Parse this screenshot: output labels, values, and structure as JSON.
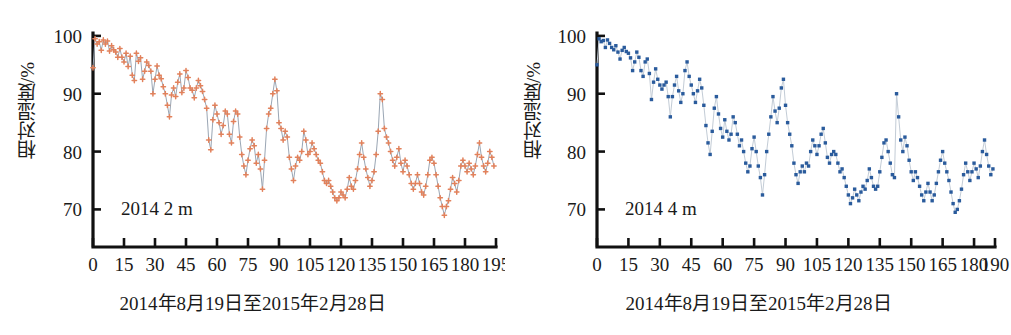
{
  "figure": {
    "background_color": "#ffffff",
    "axis_color": "#111111",
    "panels": [
      {
        "key": "left",
        "annotation": "2014  2 m",
        "caption": "2014年8月19日至2015年2月28日",
        "y_axis_title": "相对湿度/%",
        "marker_color": "#e2815b",
        "line_color": "#9aa6b4"
      },
      {
        "key": "right",
        "annotation": "2014  4 m",
        "caption": "2014年8月19日至2015年2月28日",
        "y_axis_title": "相对湿度/%",
        "marker_color": "#2a5b9c",
        "line_color": "#c3ccd6"
      }
    ]
  },
  "chart_data": [
    {
      "type": "line",
      "title": "",
      "subtitle": "",
      "annotation": "2014  2 m",
      "xlabel": "2014年8月19日至2015年2月28日",
      "ylabel": "相对湿度/%",
      "xlim": [
        0,
        195
      ],
      "ylim": [
        63.5,
        100.5
      ],
      "xticks": [
        0,
        15,
        30,
        45,
        60,
        75,
        90,
        105,
        120,
        135,
        150,
        165,
        180,
        195
      ],
      "xtick_labels": [
        "0",
        "15",
        "30",
        "45",
        "60",
        "75",
        "90",
        "105",
        "120",
        "135",
        "150",
        "165",
        "180",
        "195"
      ],
      "yticks": [
        70,
        80,
        90,
        100
      ],
      "ytick_labels": [
        "70",
        "80",
        "90",
        "100"
      ],
      "grid": false,
      "legend": "none",
      "marker": "cross",
      "marker_color": "#e2815b",
      "line_color": "#9aa6b4",
      "series": [
        {
          "name": "2014 2 m",
          "x": [
            0,
            1,
            2,
            3,
            4,
            5,
            6,
            7,
            8,
            9,
            10,
            11,
            12,
            13,
            14,
            15,
            16,
            17,
            18,
            19,
            20,
            21,
            22,
            23,
            24,
            25,
            26,
            27,
            28,
            29,
            30,
            31,
            32,
            33,
            34,
            35,
            36,
            37,
            38,
            39,
            40,
            41,
            42,
            43,
            44,
            45,
            46,
            47,
            48,
            49,
            50,
            51,
            52,
            53,
            54,
            55,
            56,
            57,
            58,
            59,
            60,
            61,
            62,
            63,
            64,
            65,
            66,
            67,
            68,
            69,
            70,
            71,
            72,
            73,
            74,
            75,
            76,
            77,
            78,
            79,
            80,
            81,
            82,
            83,
            84,
            85,
            86,
            87,
            88,
            89,
            90,
            91,
            92,
            93,
            94,
            95,
            96,
            97,
            98,
            99,
            100,
            101,
            102,
            103,
            104,
            105,
            106,
            107,
            108,
            109,
            110,
            111,
            112,
            113,
            114,
            115,
            116,
            117,
            118,
            119,
            120,
            121,
            122,
            123,
            124,
            125,
            126,
            127,
            128,
            129,
            130,
            131,
            132,
            133,
            134,
            135,
            136,
            137,
            138,
            139,
            140,
            141,
            142,
            143,
            144,
            145,
            146,
            147,
            148,
            149,
            150,
            151,
            152,
            153,
            154,
            155,
            156,
            157,
            158,
            159,
            160,
            161,
            162,
            163,
            164,
            165,
            166,
            167,
            168,
            169,
            170,
            171,
            172,
            173,
            174,
            175,
            176,
            177,
            178,
            179,
            180,
            181,
            182,
            183,
            184,
            185,
            186,
            187,
            188,
            189,
            190,
            191,
            192,
            193,
            194
          ],
          "values": [
            94.5,
            99.5,
            98.6,
            99.0,
            97.5,
            99.3,
            98.6,
            99.1,
            97.4,
            98.3,
            97.6,
            97.2,
            96.3,
            97.8,
            96.3,
            95.5,
            97.0,
            94.7,
            96.5,
            93.2,
            92.3,
            97.0,
            95.6,
            96.2,
            92.5,
            93.9,
            95.5,
            94.9,
            93.9,
            90.0,
            92.5,
            94.8,
            93.2,
            92.6,
            91.2,
            90.0,
            88.0,
            86.0,
            89.8,
            91.0,
            89.5,
            92.0,
            93.4,
            90.2,
            91.0,
            94.0,
            92.8,
            91.0,
            90.6,
            89.3,
            91.0,
            92.3,
            91.4,
            90.4,
            89.0,
            87.5,
            82.0,
            80.3,
            85.5,
            88.0,
            86.5,
            85.0,
            83.0,
            84.5,
            87.0,
            86.5,
            83.0,
            81.5,
            85.2,
            87.0,
            86.5,
            82.5,
            79.5,
            77.5,
            76.0,
            78.5,
            80.5,
            82.0,
            81.0,
            78.0,
            79.5,
            77.0,
            73.5,
            78.5,
            84.0,
            86.5,
            87.5,
            90.0,
            92.5,
            90.5,
            85.0,
            84.0,
            82.0,
            83.5,
            82.5,
            79.0,
            77.0,
            75.0,
            77.5,
            79.0,
            78.5,
            80.0,
            83.5,
            82.0,
            79.5,
            80.0,
            81.5,
            80.5,
            79.5,
            78.5,
            78.0,
            76.5,
            75.0,
            74.5,
            75.0,
            74.0,
            73.0,
            72.0,
            71.5,
            72.0,
            73.0,
            72.5,
            72.0,
            73.5,
            75.5,
            74.0,
            73.5,
            75.0,
            77.0,
            79.5,
            81.5,
            79.0,
            77.0,
            75.5,
            74.0,
            75.0,
            76.5,
            79.5,
            83.5,
            90.0,
            89.0,
            84.0,
            82.5,
            81.5,
            80.0,
            78.5,
            77.5,
            79.0,
            80.5,
            78.0,
            76.5,
            78.5,
            77.5,
            76.0,
            74.5,
            73.5,
            74.5,
            76.0,
            74.5,
            73.0,
            72.5,
            74.0,
            76.0,
            78.5,
            79.0,
            78.0,
            76.0,
            74.0,
            72.0,
            70.5,
            69.0,
            70.5,
            71.5,
            73.5,
            75.5,
            74.5,
            73.0,
            75.0,
            77.5,
            78.5,
            77.5,
            76.5,
            78.0,
            77.0,
            76.0,
            77.5,
            79.5,
            81.5,
            79.0,
            77.5,
            76.5,
            78.0,
            80.0,
            79.0,
            77.5,
            76.0,
            74.0,
            72.5,
            74.0,
            76.5,
            78.0,
            73.0
          ]
        }
      ]
    },
    {
      "type": "line",
      "title": "",
      "subtitle": "",
      "annotation": "2014  4 m",
      "xlabel": "2014年8月19日至2015年2月28日",
      "ylabel": "相对湿度/%",
      "xlim": [
        0,
        190
      ],
      "ylim": [
        63.5,
        100.5
      ],
      "xticks": [
        0,
        15,
        30,
        45,
        60,
        75,
        90,
        105,
        120,
        135,
        150,
        165,
        180,
        190
      ],
      "xtick_labels": [
        "0",
        "15",
        "30",
        "45",
        "60",
        "75",
        "90",
        "105",
        "120",
        "135",
        "150",
        "165",
        "180",
        "190"
      ],
      "yticks": [
        70,
        80,
        90,
        100
      ],
      "ytick_labels": [
        "70",
        "80",
        "90",
        "100"
      ],
      "grid": false,
      "legend": "none",
      "marker": "square",
      "marker_color": "#2a5b9c",
      "line_color": "#c3ccd6",
      "series": [
        {
          "name": "2014 4 m",
          "x": [
            0,
            1,
            2,
            3,
            4,
            5,
            6,
            7,
            8,
            9,
            10,
            11,
            12,
            13,
            14,
            15,
            16,
            17,
            18,
            19,
            20,
            21,
            22,
            23,
            24,
            25,
            26,
            27,
            28,
            29,
            30,
            31,
            32,
            33,
            34,
            35,
            36,
            37,
            38,
            39,
            40,
            41,
            42,
            43,
            44,
            45,
            46,
            47,
            48,
            49,
            50,
            51,
            52,
            53,
            54,
            55,
            56,
            57,
            58,
            59,
            60,
            61,
            62,
            63,
            64,
            65,
            66,
            67,
            68,
            69,
            70,
            71,
            72,
            73,
            74,
            75,
            76,
            77,
            78,
            79,
            80,
            81,
            82,
            83,
            84,
            85,
            86,
            87,
            88,
            89,
            90,
            91,
            92,
            93,
            94,
            95,
            96,
            97,
            98,
            99,
            100,
            101,
            102,
            103,
            104,
            105,
            106,
            107,
            108,
            109,
            110,
            111,
            112,
            113,
            114,
            115,
            116,
            117,
            118,
            119,
            120,
            121,
            122,
            123,
            124,
            125,
            126,
            127,
            128,
            129,
            130,
            131,
            132,
            133,
            134,
            135,
            136,
            137,
            138,
            139,
            140,
            141,
            142,
            143,
            144,
            145,
            146,
            147,
            148,
            149,
            150,
            151,
            152,
            153,
            154,
            155,
            156,
            157,
            158,
            159,
            160,
            161,
            162,
            163,
            164,
            165,
            166,
            167,
            168,
            169,
            170,
            171,
            172,
            173,
            174,
            175,
            176,
            177,
            178,
            179,
            180,
            181,
            182,
            183,
            184,
            185,
            186,
            187,
            188,
            189
          ],
          "values": [
            95.0,
            99.5,
            99.0,
            99.2,
            98.0,
            99.3,
            98.7,
            98.0,
            97.6,
            98.3,
            97.2,
            96.0,
            97.5,
            98.0,
            97.3,
            97.0,
            96.2,
            94.0,
            95.5,
            97.2,
            96.3,
            94.0,
            93.0,
            95.5,
            96.0,
            93.5,
            89.0,
            92.0,
            94.3,
            92.5,
            91.5,
            90.8,
            91.5,
            92.0,
            89.5,
            86.0,
            89.5,
            91.5,
            93.0,
            90.5,
            88.5,
            90.0,
            94.0,
            95.5,
            93.0,
            91.5,
            90.0,
            88.5,
            90.5,
            92.5,
            91.0,
            88.0,
            84.5,
            81.5,
            79.5,
            83.5,
            87.5,
            89.5,
            86.5,
            84.0,
            82.5,
            85.5,
            83.5,
            82.0,
            83.0,
            86.0,
            85.0,
            83.0,
            81.0,
            82.0,
            80.0,
            78.0,
            76.5,
            77.5,
            80.5,
            82.5,
            80.0,
            77.5,
            75.5,
            72.5,
            76.0,
            80.0,
            83.0,
            86.0,
            89.5,
            87.0,
            85.0,
            87.5,
            91.0,
            92.5,
            88.0,
            85.0,
            83.0,
            81.0,
            78.0,
            76.0,
            74.5,
            76.5,
            77.5,
            76.5,
            78.0,
            77.5,
            80.0,
            82.0,
            81.0,
            79.5,
            81.0,
            83.0,
            84.0,
            81.5,
            79.0,
            78.0,
            79.5,
            80.0,
            79.5,
            78.0,
            76.5,
            77.0,
            75.5,
            74.0,
            72.5,
            71.0,
            72.0,
            73.5,
            72.5,
            71.5,
            73.0,
            74.0,
            73.5,
            75.0,
            77.0,
            75.5,
            74.0,
            73.5,
            74.0,
            76.5,
            79.0,
            81.5,
            82.0,
            80.0,
            78.0,
            76.0,
            75.5,
            90.0,
            86.0,
            82.0,
            80.0,
            82.5,
            81.0,
            78.5,
            76.5,
            75.0,
            76.5,
            75.5,
            74.0,
            72.5,
            71.5,
            73.0,
            74.5,
            73.0,
            71.5,
            72.5,
            74.5,
            76.5,
            78.5,
            80.0,
            78.0,
            76.5,
            75.0,
            73.0,
            71.0,
            69.5,
            70.0,
            71.5,
            73.5,
            76.0,
            78.0,
            76.5,
            75.0,
            76.5,
            78.0,
            77.0,
            75.5,
            77.5,
            80.0,
            82.0,
            79.5,
            77.5,
            76.0,
            77.0,
            78.5,
            76.0,
            74.5,
            73.0
          ]
        }
      ]
    }
  ]
}
